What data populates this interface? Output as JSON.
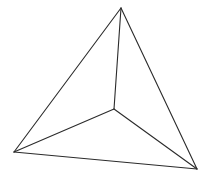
{
  "figure": {
    "kind": "wireframe-line-drawing",
    "shape_name": "tetrahedron",
    "canvas": {
      "width": 210,
      "height": 177,
      "background_color": "#ffffff"
    },
    "style": {
      "stroke_color": "#2b2b2b",
      "stroke_width": 1.1,
      "fill": "none"
    },
    "vertices": [
      {
        "id": "apex",
        "label": "A",
        "x": 121,
        "y": 8
      },
      {
        "id": "bottom-left",
        "label": "B",
        "x": 14,
        "y": 152
      },
      {
        "id": "bottom-right",
        "label": "C",
        "x": 197,
        "y": 169
      },
      {
        "id": "center",
        "label": "D",
        "x": 114,
        "y": 109
      }
    ],
    "edges": [
      {
        "id": "edge-apex-bottom-left",
        "from": "apex",
        "to": "bottom-left",
        "kind": "outer"
      },
      {
        "id": "edge-apex-bottom-right",
        "from": "apex",
        "to": "bottom-right",
        "kind": "outer"
      },
      {
        "id": "edge-bottom-left-right",
        "from": "bottom-left",
        "to": "bottom-right",
        "kind": "outer"
      },
      {
        "id": "edge-center-apex",
        "from": "center",
        "to": "apex",
        "kind": "spoke"
      },
      {
        "id": "edge-center-bottom-left",
        "from": "center",
        "to": "bottom-left",
        "kind": "spoke"
      },
      {
        "id": "edge-center-bottom-right",
        "from": "center",
        "to": "bottom-right",
        "kind": "spoke"
      }
    ]
  }
}
